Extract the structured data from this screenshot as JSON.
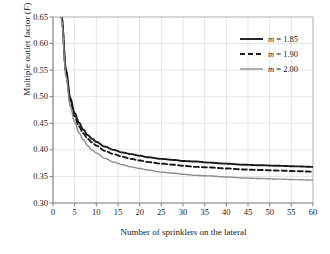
{
  "chart_data": {
    "type": "line",
    "title": "",
    "xlabel": "Number of sprinklers on the lateral",
    "ylabel": "Multiple outlet factor (F)",
    "ylabel_symbol": "F",
    "xlim": [
      0,
      60
    ],
    "ylim": [
      0.3,
      0.65
    ],
    "grid": true,
    "legend_position": "top-right",
    "xticks": [
      0,
      5,
      10,
      15,
      20,
      25,
      30,
      35,
      40,
      45,
      50,
      55,
      60
    ],
    "yticks": [
      "0.30",
      "0.35",
      "0.40",
      "0.45",
      "0.50",
      "0.55",
      "0.60",
      "0.65"
    ],
    "xtick_labels": [
      "0",
      "5",
      "10",
      "15",
      "20",
      "25",
      "30",
      "35",
      "40",
      "45",
      "50",
      "55",
      "60"
    ],
    "ytick_labels": [
      "0.30",
      "0.35",
      "0.40",
      "0.45",
      "0.50",
      "0.55",
      "0.60",
      "0.65"
    ],
    "x": [
      2,
      3,
      4,
      5,
      6,
      7,
      8,
      9,
      10,
      12,
      14,
      16,
      18,
      20,
      22,
      25,
      28,
      30,
      33,
      36,
      40,
      44,
      48,
      52,
      56,
      60
    ],
    "series": [
      {
        "name": "m = 1.85",
        "m_value": "1.85",
        "style": "solid",
        "color": "#1a1a1a",
        "width": 1.9,
        "values": [
          0.65,
          0.55,
          0.497,
          0.469,
          0.451,
          0.438,
          0.428,
          0.421,
          0.415,
          0.406,
          0.4,
          0.395,
          0.392,
          0.389,
          0.386,
          0.383,
          0.381,
          0.379,
          0.378,
          0.376,
          0.374,
          0.372,
          0.371,
          0.37,
          0.369,
          0.368
        ]
      },
      {
        "name": "m = 1.90",
        "m_value": "1.90",
        "style": "dashed",
        "color": "#1a1a1a",
        "width": 1.9,
        "values": [
          0.648,
          0.546,
          0.492,
          0.463,
          0.444,
          0.431,
          0.421,
          0.414,
          0.408,
          0.398,
          0.392,
          0.387,
          0.383,
          0.38,
          0.377,
          0.374,
          0.372,
          0.37,
          0.368,
          0.367,
          0.365,
          0.363,
          0.362,
          0.361,
          0.36,
          0.359
        ]
      },
      {
        "name": "m = 2.00",
        "m_value": "2.00",
        "style": "solid",
        "color": "#8c8c8c",
        "width": 1.4,
        "values": [
          0.644,
          0.538,
          0.482,
          0.452,
          0.432,
          0.419,
          0.408,
          0.4,
          0.394,
          0.384,
          0.377,
          0.372,
          0.368,
          0.365,
          0.362,
          0.358,
          0.356,
          0.354,
          0.352,
          0.351,
          0.349,
          0.347,
          0.346,
          0.345,
          0.344,
          0.343
        ]
      }
    ]
  },
  "legend": {
    "entries": [
      {
        "label_prefix": "m",
        "label_rest": " = 1.85"
      },
      {
        "label_prefix": "m",
        "label_rest": " = 1.90"
      },
      {
        "label_prefix": "m",
        "label_rest": " = 2.00"
      }
    ]
  },
  "axis": {
    "y_title_prefix": "Multiple outlet factor (",
    "y_title_symbol": "F",
    "y_title_suffix": ")"
  },
  "colors": {
    "axis": "#808080",
    "grid": "#d9d9d9",
    "series_dark": "#1a1a1a",
    "series_gray": "#8c8c8c",
    "text": "#1a1a1a"
  }
}
